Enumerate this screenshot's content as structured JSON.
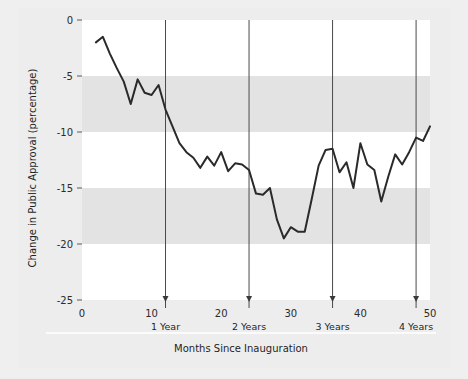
{
  "chart_data": {
    "type": "line",
    "title": "",
    "xlabel": "Months Since Inauguration",
    "ylabel": "Change in Public Approval (percentage)",
    "xlim": [
      0,
      50
    ],
    "ylim": [
      -25,
      0
    ],
    "grid": false,
    "legend": "none",
    "xticks": [
      0,
      10,
      20,
      30,
      40,
      50
    ],
    "xtick_labels": [
      "0",
      "10",
      "20",
      "30",
      "40",
      "50"
    ],
    "yticks": [
      0,
      -5,
      -10,
      -15,
      -20,
      -25
    ],
    "ytick_labels": [
      "0",
      "-5",
      "-10",
      "-15",
      "-20",
      "-25"
    ],
    "band_ranges": [
      {
        "from": 0,
        "to": -5,
        "color": "#ffffff"
      },
      {
        "from": -5,
        "to": -10,
        "color": "#e3e3e3"
      },
      {
        "from": -10,
        "to": -15,
        "color": "#ffffff"
      },
      {
        "from": -15,
        "to": -20,
        "color": "#e3e3e3"
      },
      {
        "from": -20,
        "to": -25,
        "color": "#ffffff"
      }
    ],
    "annotations": [
      {
        "label": "1 Year",
        "x": 12
      },
      {
        "label": "2 Years",
        "x": 24
      },
      {
        "label": "3 Years",
        "x": 36
      },
      {
        "label": "4 Years",
        "x": 48
      }
    ],
    "series": [
      {
        "name": "Change in Public Approval",
        "color": "#2a2a2a",
        "x": [
          2,
          3,
          4,
          5,
          6,
          7,
          8,
          9,
          10,
          11,
          12,
          13,
          14,
          15,
          16,
          17,
          18,
          19,
          20,
          21,
          22,
          23,
          24,
          25,
          26,
          27,
          28,
          29,
          30,
          31,
          32,
          33,
          34,
          35,
          36,
          37,
          38,
          39,
          40,
          41,
          42,
          43,
          44,
          45,
          46,
          47,
          48,
          49,
          50
        ],
        "y": [
          -2.0,
          -1.5,
          -3.0,
          -4.3,
          -5.5,
          -7.5,
          -5.3,
          -6.5,
          -6.7,
          -5.8,
          -8.0,
          -9.5,
          -11.0,
          -11.8,
          -12.3,
          -13.2,
          -12.2,
          -13.0,
          -11.8,
          -13.5,
          -12.8,
          -12.9,
          -13.4,
          -15.5,
          -15.6,
          -15.0,
          -17.8,
          -19.5,
          -18.5,
          -18.9,
          -18.9,
          -16.0,
          -13.0,
          -11.6,
          -11.5,
          -13.6,
          -12.7,
          -15.0,
          -11.0,
          -12.9,
          -13.4,
          -16.2,
          -14.0,
          -12.0,
          -12.9,
          -11.8,
          -10.5,
          -10.8,
          -9.5
        ]
      }
    ]
  }
}
